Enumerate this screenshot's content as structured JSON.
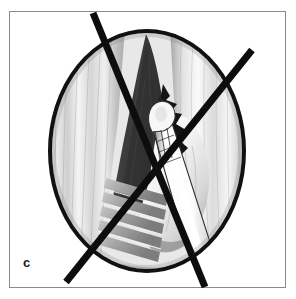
{
  "figure": {
    "panel_label": "c",
    "kind": "medical-illustration",
    "colors": {
      "frame_border": "#8a8a8a",
      "page_background": "#ffffff",
      "ink_black": "#0d0d0d",
      "scope_rim": "#111111",
      "airway_dark": "#3c3c3c",
      "airway_darkest": "#1c1c1c",
      "tissue_light": "#f2f2f2",
      "tissue_mid": "#c9c9c9",
      "tissue_shadow": "#9a9a9a",
      "instrument_white": "#fbfbfb",
      "lesion_black": "#141414"
    },
    "scope_view": {
      "shape": "ellipse",
      "center_x": 147,
      "center_y": 151,
      "radius_x": 97,
      "radius_y": 120,
      "rim_width": 4
    },
    "overlay_cross": {
      "stroke": "#0d0d0d",
      "stroke_width": 7,
      "strokes": [
        {
          "name": "stroke-down-right",
          "x1": 93,
          "y1": 13,
          "x2": 205,
          "y2": 287
        },
        {
          "name": "stroke-down-left",
          "x1": 252,
          "y1": 50,
          "x2": 66,
          "y2": 282
        }
      ]
    },
    "anatomy_parts": [
      {
        "name": "glottic-airway-triangle",
        "tone": "dark"
      },
      {
        "name": "left-vocal-fold",
        "tone": "light"
      },
      {
        "name": "right-vocal-fold",
        "tone": "light"
      },
      {
        "name": "subglottic-tracheal-rings",
        "tone": "mid"
      },
      {
        "name": "lesion-jagged-mass",
        "tone": "black"
      },
      {
        "name": "right-wall-tissue-bulge",
        "tone": "light"
      }
    ],
    "instrument": {
      "name": "probe-instrument",
      "tip_x": 166,
      "tip_y": 115,
      "shaft_angle_deg": 62,
      "color": "#fbfbfb",
      "outline": "#2a2a2a"
    }
  }
}
